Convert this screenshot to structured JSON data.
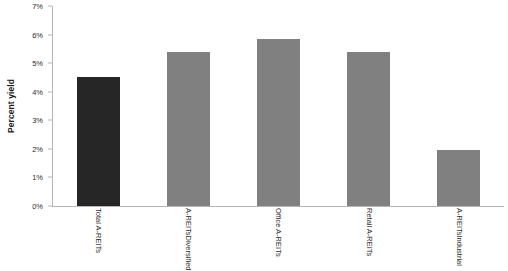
{
  "chart_data": {
    "type": "bar",
    "title": "",
    "xlabel": "",
    "ylabel": "Percent yield",
    "ylim": [
      0,
      7
    ],
    "ytick_labels": [
      "0%",
      "1%",
      "2%",
      "3%",
      "4%",
      "5%",
      "6%",
      "7%"
    ],
    "ytick_values": [
      0,
      1,
      2,
      3,
      4,
      5,
      6,
      7
    ],
    "grid": false,
    "legend": "none",
    "unit": "percent",
    "categories": [
      "Total A-REITs",
      "Diversified A-REITs",
      "Office A-REITs",
      "Retail A-REITs",
      "Industrial A-REITs"
    ],
    "category_lines": [
      [
        "Total A-REITs"
      ],
      [
        "Diversified",
        "A-REITs"
      ],
      [
        "Office A-REITs"
      ],
      [
        "Retail A-REITs"
      ],
      [
        "Industrial",
        "A-REITs"
      ]
    ],
    "values": [
      4.5,
      5.4,
      5.85,
      5.4,
      1.95
    ],
    "bar_colors": [
      "#262626",
      "#808080",
      "#808080",
      "#808080",
      "#808080"
    ],
    "colors": {
      "highlight_bar": "#262626",
      "standard_bar": "#808080",
      "axis_line": "#b5b5b5",
      "tick_text": "#2b2b2b",
      "axis_title": "#1a1a1a",
      "background": "#ffffff"
    }
  }
}
